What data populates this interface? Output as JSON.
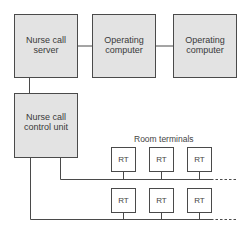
{
  "diagram": {
    "nodes": {
      "nurse_call_server": "Nurse call server",
      "operating_computer_1": "Operating computer",
      "operating_computer_2": "Operating computer",
      "nurse_call_control_unit": "Nurse call control unit"
    },
    "room_terminals_label": "Room terminals",
    "room_terminal_label": "RT",
    "room_terminal_rows": [
      [
        "RT",
        "RT",
        "RT"
      ],
      [
        "RT",
        "RT",
        "RT"
      ]
    ],
    "colors": {
      "box_fill": "#e3e3e3",
      "line": "#4a4a4a"
    }
  }
}
